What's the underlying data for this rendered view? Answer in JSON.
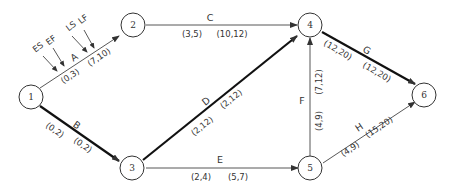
{
  "diagram": {
    "type": "activity-on-arrow network (critical path)",
    "legend": {
      "es": "ES",
      "ef": "EF",
      "ls": "LS",
      "lf": "LF"
    },
    "nodes": [
      {
        "id": "1",
        "label": "1"
      },
      {
        "id": "2",
        "label": "2"
      },
      {
        "id": "3",
        "label": "3"
      },
      {
        "id": "4",
        "label": "4"
      },
      {
        "id": "5",
        "label": "5"
      },
      {
        "id": "6",
        "label": "6"
      }
    ],
    "activities": [
      {
        "name": "A",
        "from": "1",
        "to": "2",
        "early": "(0,3)",
        "late": "(7,10)",
        "critical": false
      },
      {
        "name": "B",
        "from": "1",
        "to": "3",
        "early": "(0,2)",
        "late": "(0,2)",
        "critical": true
      },
      {
        "name": "C",
        "from": "2",
        "to": "4",
        "early": "(3,5)",
        "late": "(10,12)",
        "critical": false
      },
      {
        "name": "D",
        "from": "3",
        "to": "4",
        "early": "(2,12)",
        "late": "(2,12)",
        "critical": true
      },
      {
        "name": "E",
        "from": "3",
        "to": "5",
        "early": "(2,4)",
        "late": "(5,7)",
        "critical": false
      },
      {
        "name": "F",
        "from": "5",
        "to": "4",
        "early": "(4,9)",
        "late": "(7,12)",
        "critical": false
      },
      {
        "name": "G",
        "from": "4",
        "to": "6",
        "early": "(12,20)",
        "late": "(12,20)",
        "critical": true
      },
      {
        "name": "H",
        "from": "5",
        "to": "6",
        "early": "(4,9)",
        "late": "(15,20)",
        "critical": false
      }
    ]
  }
}
